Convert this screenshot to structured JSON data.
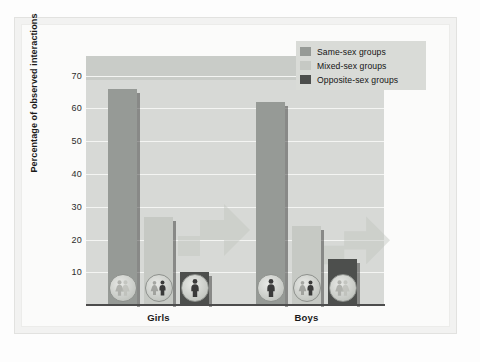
{
  "chart_data": {
    "type": "bar",
    "title": "",
    "subtitle": "",
    "xlabel": "",
    "ylabel": "Percentage of observed interactions",
    "categories": [
      "Girls",
      "Boys"
    ],
    "series": [
      {
        "name": "Same-sex groups",
        "color": "#969a96",
        "values": [
          66,
          62
        ]
      },
      {
        "name": "Mixed-sex groups",
        "color": "#c6c9c4",
        "values": [
          27,
          24
        ]
      },
      {
        "name": "Opposite-sex groups",
        "color": "#4d4f4d",
        "values": [
          10,
          14
        ]
      }
    ],
    "yticks": [
      10,
      20,
      30,
      40,
      50,
      60,
      70
    ],
    "ylim": [
      0,
      76
    ],
    "grid": true,
    "legend_position": "top-right",
    "annotations": [
      {
        "group": "Girls",
        "series": "Same-sex groups",
        "icon": "two-girls-icon"
      },
      {
        "group": "Girls",
        "series": "Mixed-sex groups",
        "icon": "girl-and-boy-icon"
      },
      {
        "group": "Girls",
        "series": "Opposite-sex groups",
        "icon": "boy-icon"
      },
      {
        "group": "Boys",
        "series": "Same-sex groups",
        "icon": "boy-icon"
      },
      {
        "group": "Boys",
        "series": "Mixed-sex groups",
        "icon": "girl-and-boy-icon"
      },
      {
        "group": "Boys",
        "series": "Opposite-sex groups",
        "icon": "two-girls-icon"
      }
    ]
  },
  "legend": {
    "items": [
      {
        "label": "Same-sex groups"
      },
      {
        "label": "Mixed-sex groups"
      },
      {
        "label": "Opposite-sex groups"
      }
    ]
  },
  "axis": {
    "y_title": "Percentage of observed interactions",
    "y_ticks": [
      "70",
      "60",
      "50",
      "40",
      "30",
      "20",
      "10"
    ],
    "x_categories": [
      "Girls",
      "Boys"
    ]
  },
  "colors": {
    "same_sex": "#969a96",
    "mixed_sex": "#c6c9c4",
    "opposite_sex": "#4d4f4d",
    "plot_background": "#d7d9d6",
    "page_background": "#fbfbfa",
    "gridline": "#f4f5f3"
  }
}
